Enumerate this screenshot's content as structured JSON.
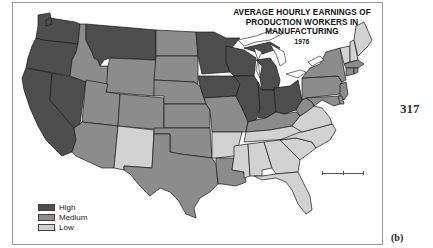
{
  "map": {
    "title_lines": [
      "AVERAGE HOURLY EARNINGS OF",
      "PRODUCTION WORKERS IN",
      "MANUFACTURING"
    ],
    "year": "1976",
    "page_number": "317",
    "panel_label": "(b)",
    "colors": {
      "High": "#4d4d4d",
      "Medium": "#8c8c8c",
      "Low": "#d2d2d2",
      "border": "#1a1a1a",
      "lakes": "#ffffff"
    },
    "legend": [
      {
        "category": "High",
        "label": "High",
        "color": "#4d4d4d"
      },
      {
        "category": "Medium",
        "label": "Medium",
        "color": "#8c8c8c"
      },
      {
        "category": "Low",
        "label": "Low",
        "color": "#d2d2d2"
      }
    ],
    "scale_bar": {
      "visible": true,
      "labels_legible": false
    }
  },
  "chart_data": {
    "type": "choropleth",
    "categories": [
      "High",
      "Medium",
      "Low"
    ],
    "regions": {
      "Washington": "High",
      "Oregon": "High",
      "California": "High",
      "Nevada": "High",
      "Montana": "High",
      "Idaho": "Medium",
      "Wyoming": "Medium",
      "Utah": "Medium",
      "Arizona": "Medium",
      "Colorado": "Medium",
      "New Mexico": "Low",
      "North Dakota": "Medium",
      "South Dakota": "Medium",
      "Nebraska": "Medium",
      "Kansas": "Medium",
      "Oklahoma": "Medium",
      "Texas": "Medium",
      "Minnesota": "High",
      "Iowa": "High",
      "Wisconsin": "High",
      "Illinois": "High",
      "Michigan": "High",
      "Indiana": "High",
      "Ohio": "High",
      "Missouri": "Medium",
      "Arkansas": "Low",
      "Louisiana": "Medium",
      "Kentucky": "Medium",
      "Tennessee": "Low",
      "Mississippi": "Low",
      "Alabama": "Low",
      "Georgia": "Low",
      "Florida": "Low",
      "South Carolina": "Low",
      "North Carolina": "Low",
      "Virginia": "Low",
      "West Virginia": "Medium",
      "Pennsylvania": "Medium",
      "New York": "Medium",
      "New Jersey": "Medium",
      "Maryland": "Medium",
      "Delaware": "Medium",
      "Connecticut": "Medium",
      "Rhode Island": "Medium",
      "Massachusetts": "Medium",
      "Vermont": "Low",
      "New Hampshire": "Low",
      "Maine": "Low"
    },
    "legend_position": "bottom-left"
  }
}
